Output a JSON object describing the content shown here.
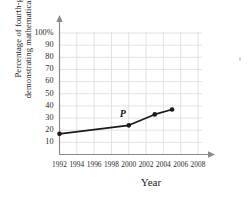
{
  "chart_data": {
    "type": "line",
    "title": "",
    "xlabel": "Year",
    "ylabel_line1": "Percentage of fourth-graders",
    "ylabel_line2": "demonstrating mathematical proficiency",
    "x": [
      1992,
      2000,
      2003,
      2005
    ],
    "values": [
      17,
      24,
      33,
      37
    ],
    "series": [
      {
        "name": "Percentage of fourth-graders demonstrating mathematical proficiency",
        "values": [
          17,
          24,
          33,
          37
        ]
      }
    ],
    "point_labels": [
      "",
      "P",
      "",
      ""
    ],
    "annotations": [
      {
        "text": "P",
        "x": 2000,
        "y": 24
      }
    ],
    "xlim": [
      1992,
      2008
    ],
    "ylim": [
      0,
      100
    ],
    "xticks": [
      1992,
      1994,
      1996,
      1998,
      2000,
      2002,
      2004,
      2006,
      2008
    ],
    "xticklabels": [
      "1992",
      "1994",
      "1996",
      "1998",
      "2000",
      "2002",
      "2004",
      "2006",
      "2008"
    ],
    "yticks": [
      10,
      20,
      30,
      40,
      50,
      60,
      70,
      80,
      90,
      100
    ],
    "yticklabels": [
      "10",
      "20",
      "30",
      "40",
      "50",
      "60",
      "70",
      "80",
      "90",
      "100%"
    ],
    "grid": true,
    "legend": null,
    "legend_position": "none",
    "marker": "filled-circle",
    "line_color": "#1a1a1a",
    "grid_color": "#e2e2e2",
    "axis_color": "#8a8a8a",
    "background": "#ffffff"
  }
}
